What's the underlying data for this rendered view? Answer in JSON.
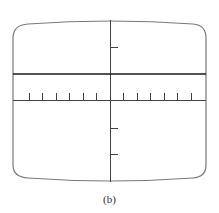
{
  "figure": {
    "caption": "(b)",
    "colors": {
      "screen_outline": "#7a7a7a",
      "axes": "#444444",
      "trace": "#1a1a1a",
      "background": "#ffffff"
    },
    "graticule": {
      "horizontal_ticks_left": 6,
      "horizontal_ticks_right": 6,
      "vertical_ticks_above_axis": 1,
      "vertical_ticks_below_axis": 2
    },
    "trace": {
      "type": "flat DC line",
      "position": "above horizontal axis"
    }
  }
}
